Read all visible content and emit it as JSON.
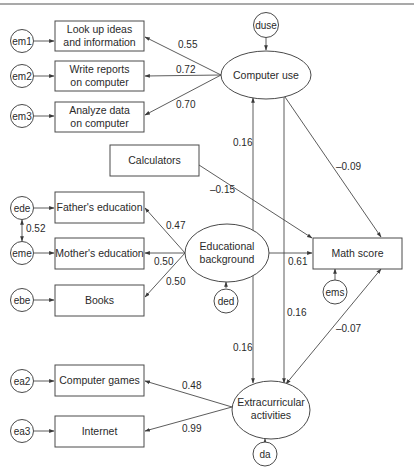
{
  "figure": {
    "type": "structural equation model path diagram",
    "observed_variables": {
      "look_up": [
        "Look up ideas",
        "and information"
      ],
      "write_reports": [
        "Write reports",
        "on computer"
      ],
      "analyze_data": [
        "Analyze data",
        "on computer"
      ],
      "calculators": "Calculators",
      "fathers_education": "Father's education",
      "mothers_education": "Mother's education",
      "books": "Books",
      "math_score": "Math score",
      "computer_games": "Computer games",
      "internet": "Internet"
    },
    "latent_variables": {
      "computer_use": "Computer use",
      "educational_background": [
        "Educational",
        "background"
      ],
      "extracurricular": [
        "Extracurricular",
        "activities"
      ]
    },
    "error_terms": {
      "em1": "em1",
      "em2": "em2",
      "em3": "em3",
      "ede": "ede",
      "eme": "eme",
      "ebe": "ebe",
      "ea2": "ea2",
      "ea3": "ea3",
      "duse": "duse",
      "ded": "ded",
      "ems": "ems",
      "da": "da"
    },
    "coefficients": {
      "cu_lookup": "0.55",
      "cu_write": "0.72",
      "cu_analyze": "0.70",
      "cu_math": "–0.09",
      "calc_math": "–0.15",
      "eb_father": "0.47",
      "eb_mother": "0.50",
      "eb_books": "0.50",
      "eb_math": "0.61",
      "ede_eme_cov": "0.52",
      "cu_ea_cov": "0.16",
      "cu_ea_path": "0.16",
      "eb_ea_cov": "0.16",
      "ea_math": "–0.07",
      "ea_games": "0.48",
      "ea_internet": "0.99"
    }
  }
}
